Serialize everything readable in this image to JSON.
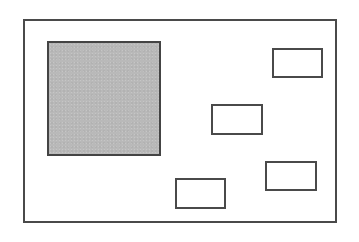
{
  "diagram": {
    "colors": {
      "border": "#4a4a4a",
      "shaded_fill": "#b9b9b9",
      "background": "#ffffff"
    },
    "frame": {
      "x": 23,
      "y": 19,
      "w": 314,
      "h": 204
    },
    "shaded_block": {
      "x": 47,
      "y": 41,
      "w": 114,
      "h": 115
    },
    "boxes": [
      {
        "id": "top-right",
        "x": 272,
        "y": 48,
        "w": 51,
        "h": 30
      },
      {
        "id": "middle",
        "x": 211,
        "y": 104,
        "w": 52,
        "h": 31
      },
      {
        "id": "lower-right",
        "x": 265,
        "y": 161,
        "w": 52,
        "h": 30
      },
      {
        "id": "bottom-center",
        "x": 175,
        "y": 178,
        "w": 51,
        "h": 31
      }
    ]
  }
}
